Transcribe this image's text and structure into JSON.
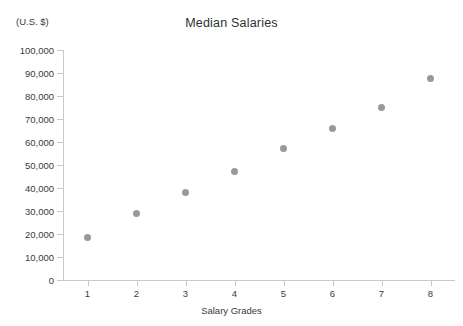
{
  "chart_data": {
    "type": "scatter",
    "title": "Median Salaries",
    "xlabel": "Salary Grades",
    "ylabel": "(U.S. $)",
    "categories": [
      "1",
      "2",
      "3",
      "4",
      "5",
      "6",
      "7",
      "8"
    ],
    "x": [
      1,
      2,
      3,
      4,
      5,
      6,
      7,
      8
    ],
    "values": [
      18500,
      29000,
      38000,
      47000,
      57000,
      66000,
      75000,
      87500
    ],
    "series": [
      {
        "name": "Median Salary",
        "values": [
          18500,
          29000,
          38000,
          47000,
          57000,
          66000,
          75000,
          87500
        ]
      }
    ],
    "ylim": [
      0,
      100000
    ],
    "xlim": [
      0.5,
      8.5
    ],
    "ytick_labels": [
      "100,000",
      "90,000",
      "80,000",
      "70,000",
      "60,000",
      "50,000",
      "40,000",
      "30,000",
      "20,000",
      "10,000",
      "0"
    ],
    "ytick_values": [
      100000,
      90000,
      80000,
      70000,
      60000,
      50000,
      40000,
      30000,
      20000,
      10000,
      0
    ],
    "xtick_labels": [
      "1",
      "2",
      "3",
      "4",
      "5",
      "6",
      "7",
      "8"
    ],
    "grid": false,
    "legend": "none",
    "marker_color": "#999999",
    "axis_color": "#c9c9c9",
    "text_color": "#3a3a3a"
  }
}
